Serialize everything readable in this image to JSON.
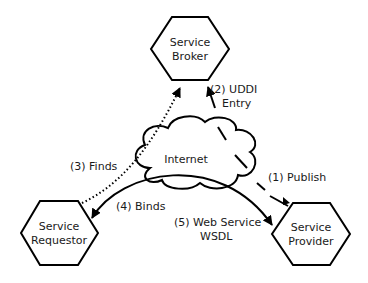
{
  "diagram": {
    "nodes": {
      "broker": {
        "line1": "Service",
        "line2": "Broker"
      },
      "requestor": {
        "line1": "Service",
        "line2": "Requestor"
      },
      "provider": {
        "line1": "Service",
        "line2": "Provider"
      },
      "internet": {
        "label": "Internet"
      }
    },
    "edges": {
      "publish": {
        "label": "(1) Publish"
      },
      "uddi": {
        "line1": "(2) UDDI",
        "line2": "Entry"
      },
      "finds": {
        "label": "(3) Finds"
      },
      "binds": {
        "label": "(4) Binds"
      },
      "wsdl": {
        "line1": "(5) Web Service",
        "line2": "WSDL"
      }
    },
    "colors": {
      "stroke": "#000000",
      "text": "#1a1a1a",
      "background": "#ffffff"
    }
  }
}
